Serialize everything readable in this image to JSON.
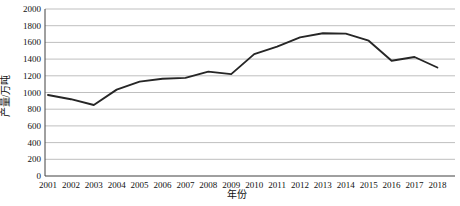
{
  "chart_data": {
    "type": "line",
    "title": "",
    "xlabel": "年份",
    "ylabel": "产量/万吨",
    "categories": [
      2001,
      2002,
      2003,
      2004,
      2005,
      2006,
      2007,
      2008,
      2009,
      2010,
      2011,
      2012,
      2013,
      2014,
      2015,
      2016,
      2017,
      2018
    ],
    "values": [
      970,
      920,
      850,
      1035,
      1130,
      1165,
      1175,
      1250,
      1220,
      1460,
      1550,
      1660,
      1710,
      1705,
      1620,
      1380,
      1425,
      1300
    ],
    "ylim": [
      0,
      2000
    ],
    "ytick_step": 200,
    "grid": "horizontal",
    "legend": "none",
    "colors": {
      "line": "#262626",
      "grid": "#bfbfbf",
      "axis": "#404040",
      "text": "#111111",
      "background": "#ffffff"
    }
  }
}
